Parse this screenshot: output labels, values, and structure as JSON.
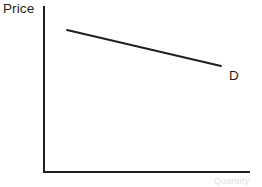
{
  "figure": {
    "background_color": "#ffffff",
    "line_color": "#231f20",
    "text_color": "#231f20"
  },
  "labels": {
    "price_axis": "Price",
    "demand_curve": "D",
    "quantity_axis_faint": "Quantity"
  },
  "chart_data": {
    "type": "line",
    "title": "",
    "subtitle": "",
    "xlabel": "",
    "ylabel": "Price",
    "grid": false,
    "legend_position": "inline-right",
    "axis_style": "open-corner-no-ticks",
    "xlim": [
      0,
      100
    ],
    "ylim": [
      0,
      100
    ],
    "annotations": [
      {
        "text": "D",
        "x": 90,
        "y": 63,
        "describes": "demand curve endpoint label"
      }
    ],
    "series": [
      {
        "name": "D",
        "description": "Downward-sloping demand curve",
        "x": [
          11.6,
          85.9
        ],
        "y": [
          85.5,
          63.9
        ],
        "points_px": [
          [
            67,
            30
          ],
          [
            221,
            66
          ]
        ],
        "color": "#231f20",
        "width_px": 2,
        "style": "solid"
      }
    ],
    "axes_px": {
      "y_axis": {
        "x": 43,
        "y_top": 6,
        "y_bottom": 172,
        "width_px": 2
      },
      "x_axis": {
        "y": 171,
        "x_left": 43,
        "x_right": 250,
        "width_px": 2
      }
    }
  }
}
